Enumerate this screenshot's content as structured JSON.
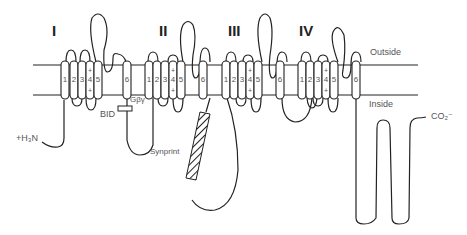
{
  "diagram": {
    "domains": [
      {
        "label": "I"
      },
      {
        "label": "II"
      },
      {
        "label": "III"
      },
      {
        "label": "IV"
      }
    ],
    "segment_labels": [
      "1",
      "2",
      "3",
      "4",
      "5",
      "6"
    ],
    "voltage_sensor_mark": "+",
    "outside_label": "Outside",
    "inside_label": "Inside",
    "n_terminus": "+H₃N",
    "c_terminus": "CO₂⁻",
    "bid_label": "BID",
    "gby_label": "Gβγ",
    "synprint_label": "Synprint",
    "colors": {
      "line": "#222222",
      "text": "#555555",
      "background": "#ffffff"
    }
  }
}
